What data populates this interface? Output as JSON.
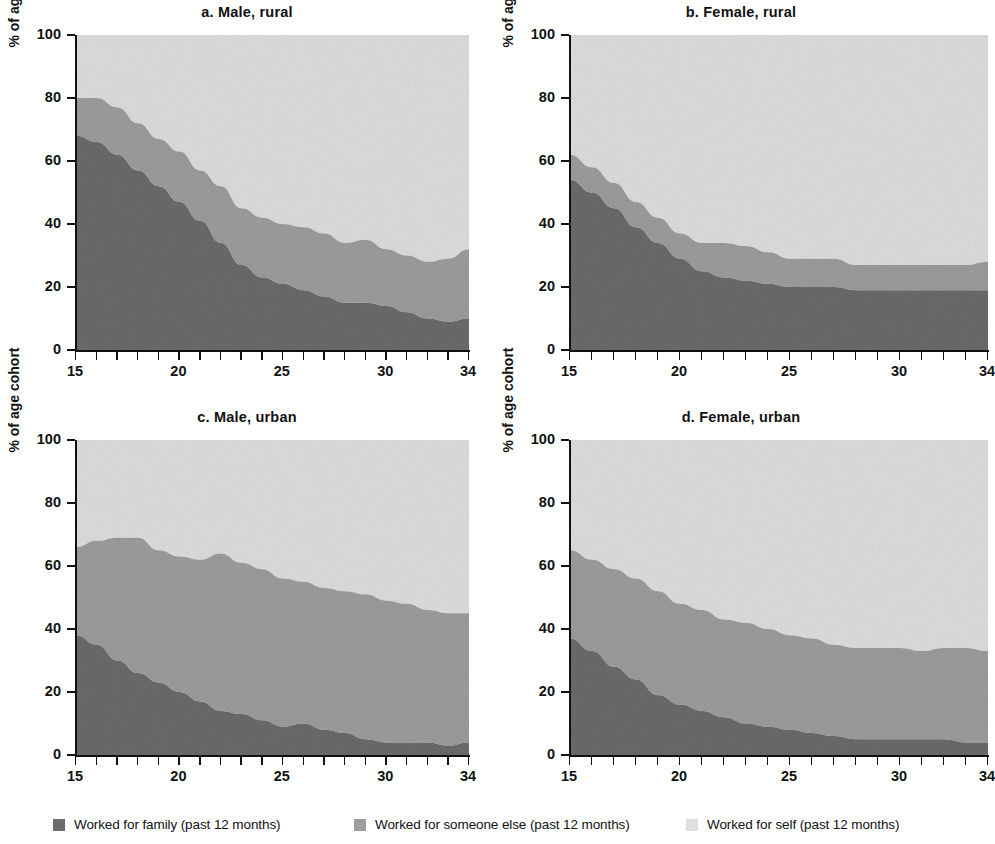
{
  "figure": {
    "ylabel": "% of age cohort",
    "xlabel": "",
    "y_ticks": [
      "0",
      "20",
      "40",
      "60",
      "80",
      "100"
    ],
    "x_ticks": [
      "15",
      "20",
      "25",
      "30",
      "34"
    ]
  },
  "legend": {
    "items": [
      {
        "label": "Worked for family (past 12 months)",
        "color": "#6b6b6b",
        "key": "family"
      },
      {
        "label": "Worked for someone else (past 12 months)",
        "color": "#9d9d9d",
        "key": "someone_else"
      },
      {
        "label": "Worked for self (past 12 months)",
        "color": "#dedede",
        "key": "self"
      }
    ]
  },
  "chart_data": [
    {
      "type": "area",
      "panel": "a",
      "title": "a.  Male, rural",
      "xlabel": "",
      "ylabel": "% of age cohort",
      "xlim": [
        15,
        34
      ],
      "ylim": [
        0,
        100
      ],
      "grid": false,
      "stacked": true,
      "legend_position": "bottom",
      "x": [
        15,
        16,
        17,
        18,
        19,
        20,
        21,
        22,
        23,
        24,
        25,
        26,
        27,
        28,
        29,
        30,
        31,
        32,
        33,
        34
      ],
      "categories": [
        "15",
        "16",
        "17",
        "18",
        "19",
        "20",
        "21",
        "22",
        "23",
        "24",
        "25",
        "26",
        "27",
        "28",
        "29",
        "30",
        "31",
        "32",
        "33",
        "34"
      ],
      "series": [
        {
          "name": "Worked for family (past 12 months)",
          "values": [
            68,
            66,
            62,
            57,
            52,
            47,
            41,
            34,
            27,
            23,
            21,
            19,
            17,
            15,
            15,
            14,
            12,
            10,
            9,
            10
          ]
        },
        {
          "name": "Worked for someone else (past 12 months)",
          "values": [
            12,
            14,
            15,
            15,
            15,
            16,
            16,
            18,
            18,
            19,
            19,
            20,
            20,
            19,
            20,
            18,
            18,
            18,
            20,
            22
          ]
        },
        {
          "name": "Worked for self (past 12 months)",
          "values": [
            20,
            20,
            23,
            28,
            33,
            37,
            43,
            48,
            55,
            58,
            60,
            61,
            63,
            66,
            65,
            68,
            70,
            72,
            71,
            68
          ]
        }
      ]
    },
    {
      "type": "area",
      "panel": "b",
      "title": "b.  Female, rural",
      "xlabel": "",
      "ylabel": "% of age cohort",
      "xlim": [
        15,
        34
      ],
      "ylim": [
        0,
        100
      ],
      "grid": false,
      "stacked": true,
      "legend_position": "bottom",
      "x": [
        15,
        16,
        17,
        18,
        19,
        20,
        21,
        22,
        23,
        24,
        25,
        26,
        27,
        28,
        29,
        30,
        31,
        32,
        33,
        34
      ],
      "categories": [
        "15",
        "16",
        "17",
        "18",
        "19",
        "20",
        "21",
        "22",
        "23",
        "24",
        "25",
        "26",
        "27",
        "28",
        "29",
        "30",
        "31",
        "32",
        "33",
        "34"
      ],
      "series": [
        {
          "name": "Worked for family (past 12 months)",
          "values": [
            54,
            50,
            45,
            39,
            34,
            29,
            25,
            23,
            22,
            21,
            20,
            20,
            20,
            19,
            19,
            19,
            19,
            19,
            19,
            19
          ]
        },
        {
          "name": "Worked for someone else (past 12 months)",
          "values": [
            8,
            8,
            8,
            8,
            8,
            8,
            9,
            11,
            11,
            10,
            9,
            9,
            9,
            8,
            8,
            8,
            8,
            8,
            8,
            9
          ]
        },
        {
          "name": "Worked for self (past 12 months)",
          "values": [
            38,
            42,
            47,
            53,
            58,
            63,
            66,
            66,
            67,
            69,
            71,
            71,
            71,
            73,
            73,
            73,
            73,
            73,
            73,
            72
          ]
        }
      ]
    },
    {
      "type": "area",
      "panel": "c",
      "title": "c.  Male, urban",
      "xlabel": "",
      "ylabel": "% of age cohort",
      "xlim": [
        15,
        34
      ],
      "ylim": [
        0,
        100
      ],
      "grid": false,
      "stacked": true,
      "legend_position": "bottom",
      "x": [
        15,
        16,
        17,
        18,
        19,
        20,
        21,
        22,
        23,
        24,
        25,
        26,
        27,
        28,
        29,
        30,
        31,
        32,
        33,
        34
      ],
      "categories": [
        "15",
        "16",
        "17",
        "18",
        "19",
        "20",
        "21",
        "22",
        "23",
        "24",
        "25",
        "26",
        "27",
        "28",
        "29",
        "30",
        "31",
        "32",
        "33",
        "34"
      ],
      "series": [
        {
          "name": "Worked for family (past 12 months)",
          "values": [
            38,
            35,
            30,
            26,
            23,
            20,
            17,
            14,
            13,
            11,
            9,
            10,
            8,
            7,
            5,
            4,
            4,
            4,
            3,
            4
          ]
        },
        {
          "name": "Worked for someone else (past 12 months)",
          "values": [
            28,
            33,
            39,
            43,
            42,
            43,
            45,
            50,
            48,
            48,
            47,
            45,
            45,
            45,
            46,
            45,
            44,
            42,
            42,
            41
          ]
        },
        {
          "name": "Worked for self (past 12 months)",
          "values": [
            34,
            32,
            31,
            31,
            35,
            37,
            38,
            36,
            39,
            41,
            44,
            45,
            47,
            48,
            49,
            51,
            52,
            54,
            55,
            55
          ]
        }
      ]
    },
    {
      "type": "area",
      "panel": "d",
      "title": "d.  Female, urban",
      "xlabel": "",
      "ylabel": "% of age cohort",
      "xlim": [
        15,
        34
      ],
      "ylim": [
        0,
        100
      ],
      "grid": false,
      "stacked": true,
      "legend_position": "bottom",
      "x": [
        15,
        16,
        17,
        18,
        19,
        20,
        21,
        22,
        23,
        24,
        25,
        26,
        27,
        28,
        29,
        30,
        31,
        32,
        33,
        34
      ],
      "categories": [
        "15",
        "16",
        "17",
        "18",
        "19",
        "20",
        "21",
        "22",
        "23",
        "24",
        "25",
        "26",
        "27",
        "28",
        "29",
        "30",
        "31",
        "32",
        "33",
        "34"
      ],
      "series": [
        {
          "name": "Worked for family (past 12 months)",
          "values": [
            37,
            33,
            28,
            24,
            19,
            16,
            14,
            12,
            10,
            9,
            8,
            7,
            6,
            5,
            5,
            5,
            5,
            5,
            4,
            4
          ]
        },
        {
          "name": "Worked for someone else (past 12 months)",
          "values": [
            28,
            29,
            31,
            32,
            33,
            32,
            32,
            31,
            32,
            31,
            30,
            30,
            29,
            29,
            29,
            29,
            28,
            29,
            30,
            29
          ]
        },
        {
          "name": "Worked for self (past 12 months)",
          "values": [
            35,
            38,
            41,
            44,
            48,
            52,
            54,
            57,
            58,
            60,
            62,
            63,
            65,
            66,
            66,
            66,
            67,
            66,
            66,
            67
          ]
        }
      ]
    }
  ]
}
